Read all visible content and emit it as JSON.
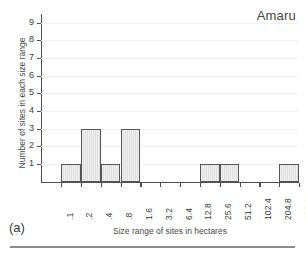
{
  "figure": {
    "panel_label": "(a)",
    "title": "Amaru"
  },
  "chart_data": {
    "type": "bar",
    "title": "Amaru",
    "xlabel": "Size range of sites in hectares",
    "ylabel": "Number of sites in each size range",
    "grid": true,
    "legend": null,
    "ylim": [
      0,
      9
    ],
    "yticks": [
      1,
      2,
      3,
      4,
      5,
      6,
      7,
      8,
      9
    ],
    "ytick_labels": [
      "1",
      "2",
      "3",
      "4",
      "5",
      "6",
      "7",
      "8",
      "9"
    ],
    "bin_edges": [
      ".1",
      ".2",
      ".4",
      ".8",
      "1.6",
      "3.2",
      "6.4",
      "12.8",
      "25.6",
      "51.2",
      "102.4",
      "204.8",
      "409.6"
    ],
    "xtick_labels": [
      ".1",
      ".2",
      ".4",
      ".8",
      "1.6",
      "3.2",
      "6.4",
      "12.8",
      "25.6",
      "51.2",
      "102.4",
      "204.8",
      "409.6"
    ],
    "categories": [
      ".1-.2",
      ".2-.4",
      ".4-.8",
      ".8-1.6",
      "1.6-3.2",
      "3.2-6.4",
      "6.4-12.8",
      "12.8-25.6",
      "25.6-51.2",
      "51.2-102.4",
      "102.4-204.8",
      "204.8-409.6"
    ],
    "values": [
      1,
      3,
      1,
      3,
      0,
      0,
      0,
      1,
      1,
      0,
      0,
      1
    ],
    "total_sites": 10,
    "bar_fill_color": "#dedede",
    "bar_edge_color": "#555555",
    "axis_color": "#4f4f4f"
  }
}
